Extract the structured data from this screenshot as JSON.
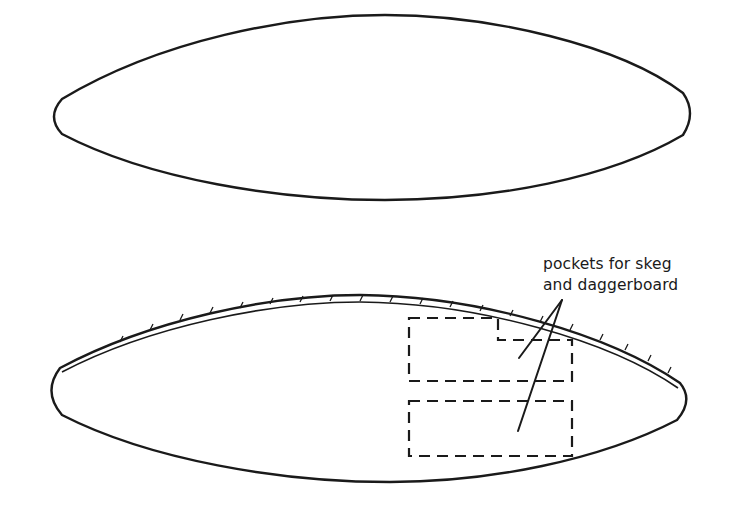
{
  "diagram": {
    "type": "technical-illustration",
    "shapes": [
      {
        "id": "top-view",
        "description": "plain lens-shaped outline"
      },
      {
        "id": "bottom-view",
        "description": "lens-shaped outline with stitched double edge and two dashed pockets",
        "pockets": [
          {
            "id": "upper-pocket",
            "style": "dashed",
            "shape": "stepped rectangle"
          },
          {
            "id": "lower-pocket",
            "style": "dashed",
            "shape": "rectangle"
          }
        ]
      }
    ],
    "annotation": {
      "line1": "pockets for skeg",
      "line2": "and daggerboard",
      "leaders": 2
    },
    "colors": {
      "ink": "#1a1a1a",
      "background": "#ffffff"
    }
  }
}
